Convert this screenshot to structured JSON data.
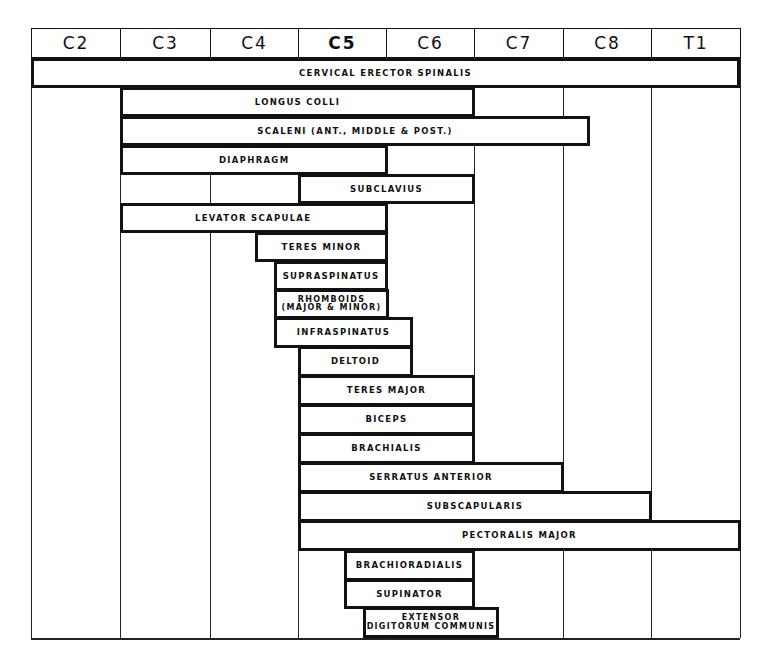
{
  "chart_data": {
    "type": "table",
    "title": "",
    "columns": [
      "C2",
      "C3",
      "C4",
      "C5",
      "C6",
      "C7",
      "C8",
      "T1"
    ],
    "header": {
      "labels": [
        "C2",
        "C3",
        "C4",
        "C5",
        "C6",
        "C7",
        "C8",
        "T1"
      ],
      "highlighted": "C5"
    },
    "muscles": [
      {
        "name": "CERVICAL ERECTOR SPINALIS",
        "start": "C2",
        "end": "T1"
      },
      {
        "name": "LONGUS COLLI",
        "start": "C3",
        "end": "C6"
      },
      {
        "name": "SCALENI (ANT., MIDDLE & POST.)",
        "start": "C3",
        "end": "C8 (partial)"
      },
      {
        "name": "DIAPHRAGM",
        "start": "C3",
        "end": "C5"
      },
      {
        "name": "SUBCLAVIUS",
        "start": "C5",
        "end": "C6"
      },
      {
        "name": "LEVATOR SCAPULAE",
        "start": "C3",
        "end": "C5"
      },
      {
        "name": "TERES MINOR",
        "start": "C4 (partial)",
        "end": "C5"
      },
      {
        "name": "SUPRASPINATUS",
        "start": "C4 (partial)",
        "end": "C5"
      },
      {
        "name": "RHOMBOIDS\n(MAJOR & MINOR)",
        "start": "C4 (partial)",
        "end": "C5"
      },
      {
        "name": "INFRASPINATUS",
        "start": "C4 (partial)",
        "end": "C6 (partial)"
      },
      {
        "name": "DELTOID",
        "start": "C5",
        "end": "C6 (partial)"
      },
      {
        "name": "TERES MAJOR",
        "start": "C5",
        "end": "C6"
      },
      {
        "name": "BICEPS",
        "start": "C5",
        "end": "C6"
      },
      {
        "name": "BRACHIALIS",
        "start": "C5",
        "end": "C6"
      },
      {
        "name": "SERRATUS ANTERIOR",
        "start": "C5",
        "end": "C7"
      },
      {
        "name": "SUBSCAPULARIS",
        "start": "C5",
        "end": "C8"
      },
      {
        "name": "PECTORALIS MAJOR",
        "start": "C5",
        "end": "T1"
      },
      {
        "name": "BRACHIORADIALIS",
        "start": "C5 (partial)",
        "end": "C6"
      },
      {
        "name": "SUPINATOR",
        "start": "C5 (partial)",
        "end": "C6"
      },
      {
        "name": "EXTENSOR\nDIGITORUM COMMUNIS",
        "start": "C5 (partial)",
        "end": "C7 (partial)"
      }
    ]
  },
  "layout": {
    "column_edges": [
      31,
      120,
      210,
      298,
      386,
      474,
      563,
      651,
      740
    ],
    "header_top": 28,
    "header_bottom": 57,
    "grid_bottom": 638,
    "bars": [
      {
        "x1": 31,
        "x2": 740,
        "y1": 58,
        "y2": 88
      },
      {
        "x1": 120,
        "x2": 475,
        "y1": 87,
        "y2": 117
      },
      {
        "x1": 120,
        "x2": 590,
        "y1": 116,
        "y2": 146
      },
      {
        "x1": 120,
        "x2": 388,
        "y1": 145,
        "y2": 175
      },
      {
        "x1": 298,
        "x2": 475,
        "y1": 174,
        "y2": 204
      },
      {
        "x1": 120,
        "x2": 388,
        "y1": 203,
        "y2": 233
      },
      {
        "x1": 255,
        "x2": 388,
        "y1": 232,
        "y2": 262
      },
      {
        "x1": 274,
        "x2": 388,
        "y1": 261,
        "y2": 291
      },
      {
        "x1": 274,
        "x2": 389,
        "y1": 289,
        "y2": 319
      },
      {
        "x1": 274,
        "x2": 413,
        "y1": 317,
        "y2": 348
      },
      {
        "x1": 298,
        "x2": 413,
        "y1": 346,
        "y2": 377
      },
      {
        "x1": 298,
        "x2": 475,
        "y1": 375,
        "y2": 406
      },
      {
        "x1": 298,
        "x2": 475,
        "y1": 404,
        "y2": 435
      },
      {
        "x1": 298,
        "x2": 475,
        "y1": 433,
        "y2": 464
      },
      {
        "x1": 298,
        "x2": 564,
        "y1": 462,
        "y2": 493
      },
      {
        "x1": 298,
        "x2": 652,
        "y1": 491,
        "y2": 522
      },
      {
        "x1": 298,
        "x2": 741,
        "y1": 520,
        "y2": 551
      },
      {
        "x1": 344,
        "x2": 475,
        "y1": 550,
        "y2": 581
      },
      {
        "x1": 344,
        "x2": 475,
        "y1": 579,
        "y2": 609
      },
      {
        "x1": 363,
        "x2": 499,
        "y1": 607,
        "y2": 638
      }
    ]
  }
}
